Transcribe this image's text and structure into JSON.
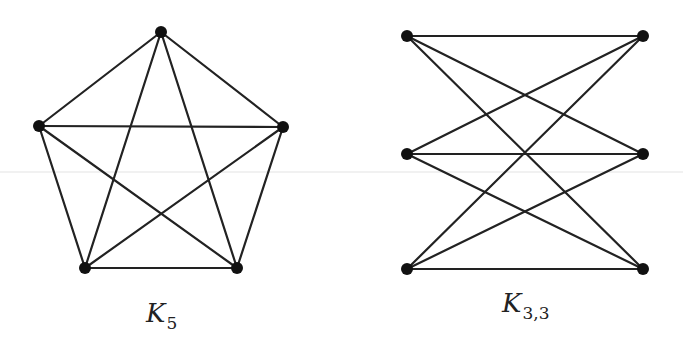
{
  "figure": {
    "graphs": [
      {
        "id": "k5",
        "label": {
          "main": "K",
          "sub": "5",
          "x": 146,
          "y": 300
        },
        "nodes": [
          {
            "id": "top",
            "x": 161,
            "y": 32
          },
          {
            "id": "left",
            "x": 39,
            "y": 126
          },
          {
            "id": "right",
            "x": 283,
            "y": 127
          },
          {
            "id": "bottom-left",
            "x": 85,
            "y": 268
          },
          {
            "id": "bottom-right",
            "x": 237,
            "y": 268
          }
        ],
        "edges": [
          [
            "top",
            "left"
          ],
          [
            "top",
            "right"
          ],
          [
            "top",
            "bottom-left"
          ],
          [
            "top",
            "bottom-right"
          ],
          [
            "left",
            "right"
          ],
          [
            "left",
            "bottom-left"
          ],
          [
            "left",
            "bottom-right"
          ],
          [
            "right",
            "bottom-left"
          ],
          [
            "right",
            "bottom-right"
          ],
          [
            "bottom-left",
            "bottom-right"
          ]
        ]
      },
      {
        "id": "k33",
        "label": {
          "main": "K",
          "sub": "3,3",
          "x": 502,
          "y": 290
        },
        "nodes": [
          {
            "id": "a1",
            "x": 407,
            "y": 36
          },
          {
            "id": "a2",
            "x": 407,
            "y": 154
          },
          {
            "id": "a3",
            "x": 407,
            "y": 269
          },
          {
            "id": "b1",
            "x": 643,
            "y": 36
          },
          {
            "id": "b2",
            "x": 643,
            "y": 154
          },
          {
            "id": "b3",
            "x": 643,
            "y": 269
          }
        ],
        "edges": [
          [
            "a1",
            "b1"
          ],
          [
            "a1",
            "b2"
          ],
          [
            "a1",
            "b3"
          ],
          [
            "a2",
            "b1"
          ],
          [
            "a2",
            "b2"
          ],
          [
            "a2",
            "b3"
          ],
          [
            "a3",
            "b1"
          ],
          [
            "a3",
            "b2"
          ],
          [
            "a3",
            "b3"
          ]
        ]
      }
    ],
    "node_radius": 6,
    "colors": {
      "edge": "#222222",
      "node": "#111111",
      "background": "#ffffff"
    }
  }
}
